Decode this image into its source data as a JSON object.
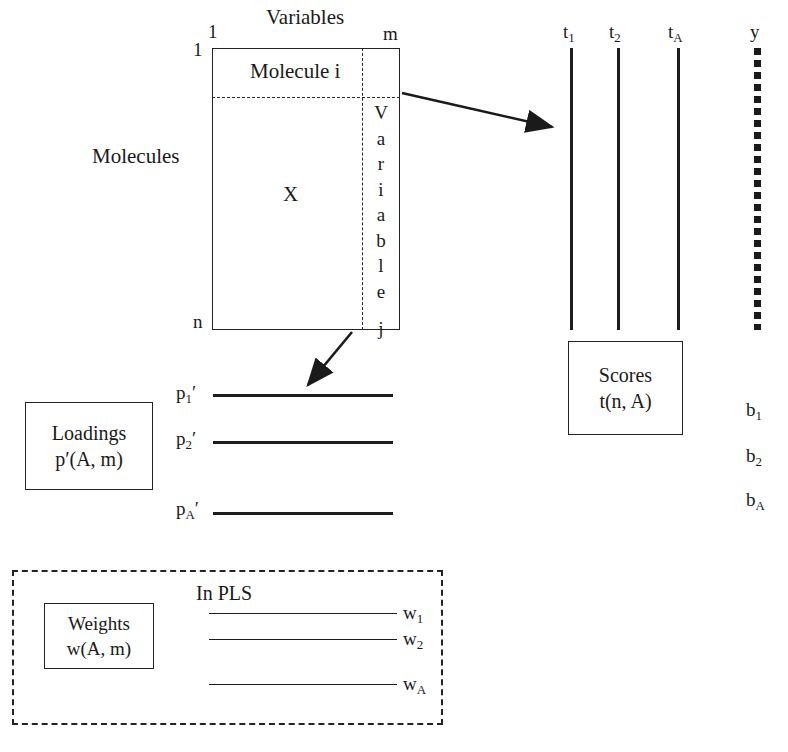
{
  "figure": {
    "ink_color": "#1a1a1a"
  },
  "matrix": {
    "top_axis_label": "Variables",
    "left_axis_label": "Molecules",
    "corner_row_first": "1",
    "corner_row_last": "n",
    "corner_col_first": "1",
    "corner_col_last": "m",
    "row_slice_label": "Molecule i",
    "body_label": "X",
    "column_slice_letters": [
      "V",
      "a",
      "r",
      "i",
      "a",
      "b",
      "l",
      "e",
      "j"
    ]
  },
  "scores": {
    "vector_labels": [
      "t",
      "t",
      "t"
    ],
    "vector_subscripts": [
      "1",
      "2",
      "A"
    ],
    "box_line1": "Scores",
    "box_line2": "t(n, A)",
    "y_label": "y"
  },
  "regression": {
    "coefficient_base": "b",
    "coefficient_subscripts": [
      "1",
      "2",
      "A"
    ]
  },
  "loadings": {
    "box_line1": "Loadings",
    "box_line2": "p′(A, m)",
    "vector_base": "p",
    "vector_prime": "′",
    "vector_subscripts": [
      "1",
      "2",
      "A"
    ]
  },
  "weights": {
    "section_label": "In PLS",
    "box_line1": "Weights",
    "box_line2": "w(A, m)",
    "vector_base": "w",
    "vector_subscripts": [
      "1",
      "2",
      "A"
    ]
  }
}
